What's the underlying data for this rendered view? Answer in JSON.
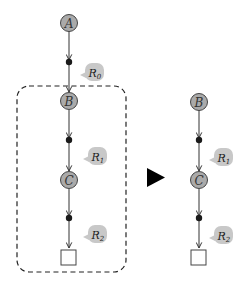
{
  "diagram": {
    "colors": {
      "node_fill": "#aaaaaa",
      "node_stroke": "#444444",
      "bubble_fill": "#c8c8c8",
      "edge": "#333333",
      "dot": "#1a1a1a",
      "dashed_box": "#222222",
      "arrow_triangle": "#000000"
    },
    "left": {
      "nodes": [
        {
          "id": "A",
          "label": "A"
        },
        {
          "id": "B",
          "label": "B"
        },
        {
          "id": "C",
          "label": "C"
        },
        {
          "id": "end",
          "label": ""
        }
      ],
      "annotations": [
        {
          "label": "R",
          "sub": "0"
        },
        {
          "label": "R",
          "sub": "1"
        },
        {
          "label": "R",
          "sub": "2"
        }
      ],
      "dashed_group": [
        "B",
        "R1",
        "C",
        "R2",
        "end"
      ]
    },
    "transform_arrow": "right-triangle",
    "right": {
      "nodes": [
        {
          "id": "B",
          "label": "B"
        },
        {
          "id": "C",
          "label": "C"
        },
        {
          "id": "end",
          "label": ""
        }
      ],
      "annotations": [
        {
          "label": "R",
          "sub": "1"
        },
        {
          "label": "R",
          "sub": "2"
        }
      ]
    }
  }
}
